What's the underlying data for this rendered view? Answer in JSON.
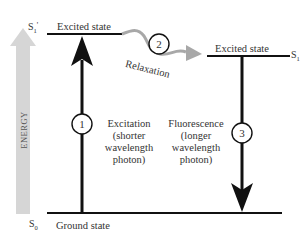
{
  "diagram": {
    "type": "energy-level (Jablonski) diagram",
    "axis": {
      "label": "ENERGY",
      "direction": "up",
      "color": "#d4d4d4"
    },
    "levels": [
      {
        "id": "S1_prime",
        "symbol": "S",
        "subscript": "1",
        "prime": "'",
        "label": "Excited state"
      },
      {
        "id": "S1",
        "symbol": "S",
        "subscript": "1",
        "prime": "",
        "label": "Excited state"
      },
      {
        "id": "S0",
        "symbol": "S",
        "subscript": "0",
        "prime": "",
        "label": "Ground state"
      }
    ],
    "steps": [
      {
        "number": "1",
        "name": "Excitation",
        "line2": "(shorter",
        "line3": "wavelength",
        "line4": "photon)",
        "from": "S0",
        "to": "S1_prime",
        "color": "#111111"
      },
      {
        "number": "2",
        "name": "Relaxation",
        "from": "S1_prime",
        "to": "S1",
        "color": "#a8a8a8"
      },
      {
        "number": "3",
        "name": "Fluorescence",
        "line2": "(longer",
        "line3": "wavelength",
        "line4": "photon)",
        "from": "S1",
        "to": "S0",
        "color": "#111111"
      }
    ]
  }
}
